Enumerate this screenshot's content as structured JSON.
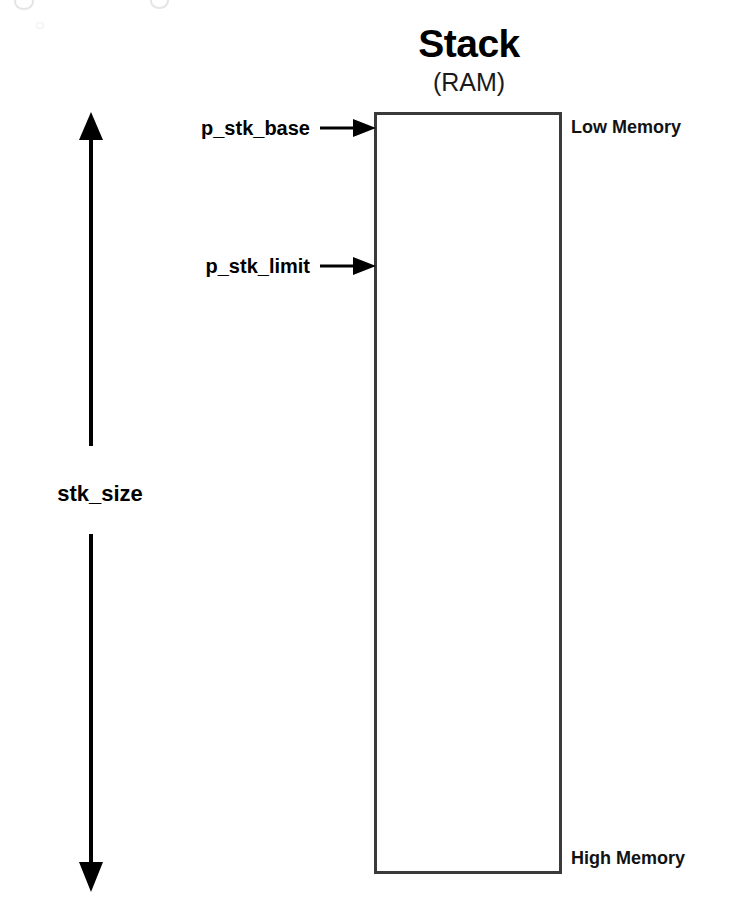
{
  "diagram": {
    "title": "Stack",
    "subtitle": "(RAM)",
    "canvas": {
      "width": 734,
      "height": 903,
      "background": "#ffffff"
    },
    "colors": {
      "stroke": "#000000",
      "box_border": "#3a3a3a",
      "text": "#000000",
      "background": "#ffffff"
    },
    "region_box": {
      "name": "stack-region",
      "label": "Stack (RAM)",
      "border_width_px": 3,
      "fill": "#ffffff"
    },
    "memory_ends": {
      "top_label": "Low Memory",
      "bottom_label": "High Memory"
    },
    "pointers": [
      {
        "name": "p_stk_base",
        "label": "p_stk_base",
        "target": "top of stack region",
        "arrow_direction": "right"
      },
      {
        "name": "p_stk_limit",
        "label": "p_stk_limit",
        "target": "interior of stack region below base",
        "arrow_direction": "right"
      }
    ],
    "size_measure": {
      "label": "stk_size",
      "arrow_direction": "double-vertical",
      "spans": "full height of stack region"
    }
  }
}
